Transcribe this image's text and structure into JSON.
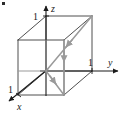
{
  "figure": {
    "background_color": "#ffffff",
    "axis_color": "#1a1a1a",
    "cube_color": "#3a3a3a",
    "vector_color": "#9a9a9a",
    "axes": [
      {
        "name": "z",
        "label": "z",
        "tick_label": "1",
        "direction": "up"
      },
      {
        "name": "y",
        "label": "y",
        "tick_label": "1",
        "direction": "right"
      },
      {
        "name": "x",
        "label": "x",
        "tick_label": "1",
        "direction": "down-left"
      }
    ],
    "labels": {
      "z_axis": "z",
      "y_axis": "y",
      "x_axis": "x",
      "z_tick": "1",
      "y_tick": "1",
      "x_tick": "1"
    },
    "vectors": [
      {
        "name": "space-diagonal",
        "from": "origin-vertex",
        "to": "back-top-vertex",
        "arrow_at": "midpoint-toward-origin"
      },
      {
        "name": "base-diagonal",
        "from": "origin-vertex",
        "to": "front-bottom-right-vertex",
        "arrow_at": "midpoint"
      },
      {
        "name": "vertical-edge",
        "from": "top-right-vertex",
        "to": "bottom-right-vertex",
        "arrow_at": "midpoint-downward"
      }
    ],
    "corner_mark": "•"
  }
}
